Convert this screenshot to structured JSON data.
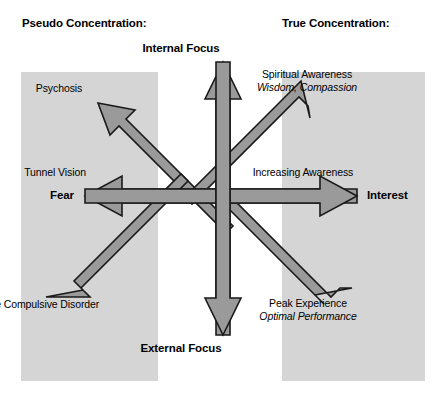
{
  "headers": {
    "left": "Pseudo Concentration:",
    "right": "True Concentration:"
  },
  "axes": {
    "top": "Internal Focus",
    "bottom": "External Focus",
    "left": "Fear",
    "right": "Interest"
  },
  "labels": {
    "psychosis": "Psychosis",
    "tunnel_vision": "Tunnel Vision",
    "ocd": "Obsessive Compulsive Disorder",
    "spiritual_title": "Spiritual Awareness",
    "spiritual_sub": "Wisdom, Compassion",
    "increasing_awareness": "Increasing Awareness",
    "peak_title": "Peak Experience",
    "peak_sub": "Optimal Performance"
  },
  "colors": {
    "panel": "#d5d5d5",
    "arrow_fill": "#9a9a9a",
    "arrow_stroke": "#1a1a1a",
    "text": "#000000",
    "background": "#ffffff"
  },
  "diagram": {
    "center_x": 223,
    "center_y": 196,
    "arrows": [
      {
        "name": "up",
        "label": "Internal Focus"
      },
      {
        "name": "down",
        "label": "External Focus"
      },
      {
        "name": "left",
        "label": "Fear"
      },
      {
        "name": "right",
        "label": "Interest"
      },
      {
        "name": "up-left",
        "label": "Psychosis"
      },
      {
        "name": "up-right",
        "label": "Spiritual Awareness"
      },
      {
        "name": "down-left",
        "label": "Obsessive Compulsive Disorder"
      },
      {
        "name": "down-right",
        "label": "Peak Experience"
      }
    ]
  }
}
